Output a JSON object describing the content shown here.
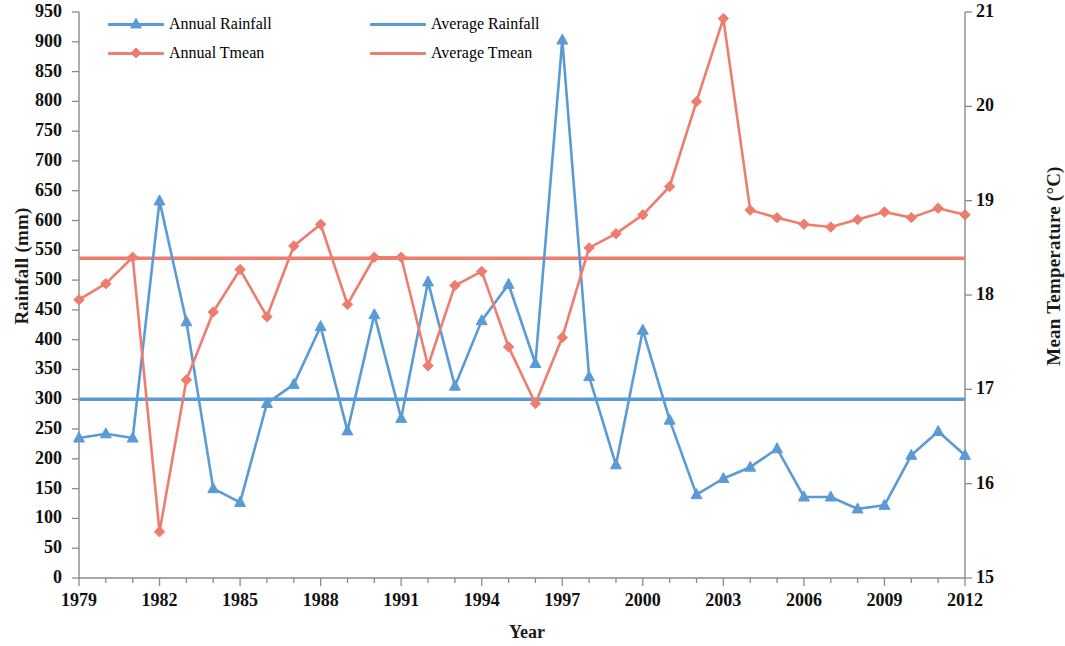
{
  "chart_data": {
    "type": "line",
    "title": "",
    "xlabel": "Year",
    "ylabel": "Rainfall (mm)",
    "ylabel_right": "Mean Temperature (°C)",
    "x": [
      1979,
      1980,
      1981,
      1982,
      1983,
      1984,
      1985,
      1986,
      1987,
      1988,
      1989,
      1990,
      1991,
      1992,
      1993,
      1994,
      1995,
      1996,
      1997,
      1998,
      1999,
      2000,
      2001,
      2002,
      2003,
      2004,
      2005,
      2006,
      2007,
      2008,
      2009,
      2010,
      2011,
      2012
    ],
    "xlim": [
      1979,
      2012
    ],
    "xtick_labels": [
      "1979",
      "1982",
      "1985",
      "1988",
      "1991",
      "1994",
      "1997",
      "2000",
      "2003",
      "2006",
      "2009",
      "2012"
    ],
    "xtick_values": [
      1979,
      1982,
      1985,
      1988,
      1991,
      1994,
      1997,
      2000,
      2003,
      2006,
      2009,
      2012
    ],
    "ylim": [
      0,
      950
    ],
    "ytick_labels": [
      "0",
      "50",
      "100",
      "150",
      "200",
      "250",
      "300",
      "350",
      "400",
      "450",
      "500",
      "550",
      "600",
      "650",
      "700",
      "750",
      "800",
      "850",
      "900",
      "950"
    ],
    "ytick_values": [
      0,
      50,
      100,
      150,
      200,
      250,
      300,
      350,
      400,
      450,
      500,
      550,
      600,
      650,
      700,
      750,
      800,
      850,
      900,
      950
    ],
    "ylim_right": [
      15,
      21
    ],
    "ytick_right_labels": [
      "15",
      "16",
      "17",
      "18",
      "19",
      "20",
      "21"
    ],
    "ytick_right_values": [
      15,
      16,
      17,
      18,
      19,
      20,
      21
    ],
    "grid": false,
    "legend_position": "top-inside",
    "series": [
      {
        "name": "Annual Rainfall",
        "axis": "left",
        "color": "#5B9BD5",
        "marker": "triangle",
        "values": [
          235,
          242,
          235,
          633,
          430,
          150,
          127,
          293,
          325,
          422,
          247,
          442,
          268,
          497,
          322,
          432,
          493,
          360,
          903,
          338,
          190,
          416,
          265,
          140,
          167,
          186,
          217,
          136,
          136,
          116,
          122,
          206,
          246,
          206
        ]
      },
      {
        "name": "Annual Tmean",
        "axis": "right",
        "color": "#ED7D6E",
        "marker": "diamond",
        "values": [
          17.95,
          18.12,
          18.4,
          15.49,
          17.1,
          17.82,
          18.27,
          17.77,
          18.52,
          18.75,
          17.9,
          18.4,
          18.4,
          17.25,
          18.1,
          18.25,
          17.45,
          16.85,
          17.55,
          18.5,
          18.65,
          18.85,
          19.15,
          20.05,
          20.93,
          18.9,
          18.82,
          18.75,
          18.72,
          18.8,
          18.88,
          18.82,
          18.92,
          18.85
        ]
      },
      {
        "name": "Average Rainfall",
        "axis": "left",
        "color": "#5B9BD5",
        "marker": "none",
        "constant": 300
      },
      {
        "name": "Average Tmean",
        "axis": "right",
        "color": "#ED7D6E",
        "marker": "none",
        "constant": 18.39
      }
    ],
    "legend": [
      {
        "label": "Annual Rainfall",
        "color": "#5B9BD5",
        "marker": "triangle"
      },
      {
        "label": "Average Rainfall",
        "color": "#5B9BD5",
        "marker": "none"
      },
      {
        "label": "Annual Tmean",
        "color": "#ED7D6E",
        "marker": "diamond"
      },
      {
        "label": "Average Tmean",
        "color": "#ED7D6E",
        "marker": "none"
      }
    ]
  },
  "axes": {
    "left_title": "Rainfall (mm)",
    "right_title": "Mean Temperature (°C)",
    "x_title": "Year"
  }
}
